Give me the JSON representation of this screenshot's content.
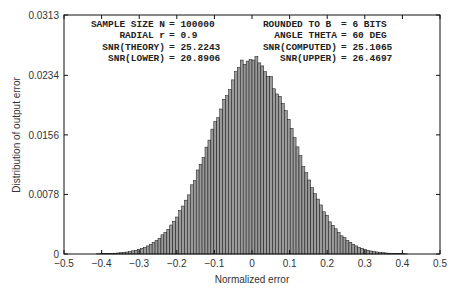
{
  "chart_data": {
    "type": "bar",
    "title": "",
    "xlabel": "Normalized error",
    "ylabel": "Distribution of output error",
    "xlim": [
      -0.5,
      0.5
    ],
    "ylim": [
      0,
      0.0313
    ],
    "xticks": [
      "-0.5",
      "-0.4",
      "-0.3",
      "-0.2",
      "-0.1",
      "0",
      "0.1",
      "0.2",
      "0.3",
      "0.4",
      "0.5"
    ],
    "yticks": [
      "0",
      "0.0078",
      "0.0156",
      "0.0234",
      "0.0313"
    ],
    "grid": false,
    "legend": null,
    "bar_fill": "#9a9a9a",
    "bar_edge": "#111111",
    "distribution": {
      "shape": "gaussian",
      "mean": 0.0,
      "std": 0.11,
      "peak": 0.0255,
      "bin_width": 0.0078125
    },
    "annotations_left": [
      {
        "label": "SAMPLE SIZE N",
        "value": "100000"
      },
      {
        "label": "RADIAL r",
        "value": "0.9"
      },
      {
        "label": "SNR(THEORY)",
        "value": "25.2243"
      },
      {
        "label": "SNR(LOWER)",
        "value": "20.8906"
      }
    ],
    "annotations_right": [
      {
        "label": "ROUNDED TO B ",
        "value": "6 BITS"
      },
      {
        "label": "ANGLE THETA",
        "value": "60 DEG"
      },
      {
        "label": "SNR(COMPUTED)",
        "value": "25.1065"
      },
      {
        "label": "SNR(UPPER)",
        "value": "26.4697"
      }
    ]
  }
}
